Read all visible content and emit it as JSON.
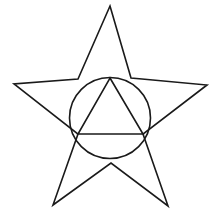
{
  "figure": {
    "background_color": "#ffffff",
    "stroke_color": "#1a1a1a",
    "stroke_width": 1.6,
    "canvas": {
      "width": 220,
      "height": 221
    },
    "shapes": {
      "star": {
        "name": "five-pointed-star",
        "points": "110,6 131,78 142,79 207,85 143,134 168,206 111,163 53,205 78,134 14,84 78,79",
        "outer_points": [
          {
            "label": "top",
            "x": 110,
            "y": 6
          },
          {
            "label": "right",
            "x": 207,
            "y": 85
          },
          {
            "label": "bottom-right",
            "x": 168,
            "y": 206
          },
          {
            "label": "bottom-left",
            "x": 53,
            "y": 205
          },
          {
            "label": "left",
            "x": 14,
            "y": 84
          }
        ],
        "inner_points": [
          {
            "label": "upper-right",
            "x": 142,
            "y": 79
          },
          {
            "label": "lower-right",
            "x": 143,
            "y": 134
          },
          {
            "label": "bottom",
            "x": 111,
            "y": 163
          },
          {
            "label": "lower-left",
            "x": 78,
            "y": 134
          },
          {
            "label": "upper-left",
            "x": 78,
            "y": 79
          }
        ]
      },
      "circle": {
        "name": "inscribed-circle",
        "center_x": 110,
        "center_y": 118,
        "radius": 40.5
      },
      "triangle": {
        "name": "inscribed-triangle",
        "points": "110,78 143,134 78,134",
        "vertices": [
          {
            "label": "apex",
            "x": 110,
            "y": 78
          },
          {
            "label": "base-right",
            "x": 143,
            "y": 134
          },
          {
            "label": "base-left",
            "x": 78,
            "y": 134
          }
        ]
      }
    }
  }
}
